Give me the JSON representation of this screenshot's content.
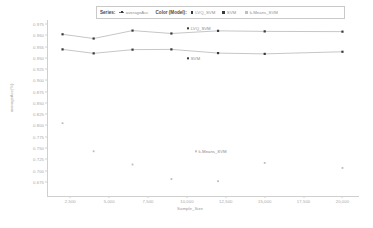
{
  "legend": {
    "series_title": "Series:",
    "series_item": "averageAcc",
    "color_title": "Color (Model):",
    "models": [
      "LVQ_SVM",
      "SVM",
      "k-Means_SVM"
    ]
  },
  "annotations": [
    {
      "text": "LVQ_SVM",
      "x": 10000,
      "y": 0.972
    },
    {
      "text": "SVM",
      "x": 10000,
      "y": 0.949
    },
    {
      "text": "k-Means_SVM",
      "x": 10500,
      "y": 0.879
    }
  ],
  "chart_data": {
    "type": "scatter",
    "title": "",
    "xlabel": "Sample_Size",
    "ylabel": "averageAcc(%)",
    "xlim": [
      1000,
      21000
    ],
    "ylim": [
      0.845,
      0.978
    ],
    "grid": false,
    "legend_position": "top",
    "xticks": [
      2500,
      5000,
      7500,
      10000,
      12500,
      15000,
      17500,
      20000
    ],
    "xtick_labels": [
      "2,500",
      "5,000",
      "7,500",
      "10,000",
      "12,500",
      "15,000",
      "17,500",
      "20,000"
    ],
    "yticks": [
      0.975,
      0.96,
      0.955,
      0.95,
      0.925,
      0.9,
      0.875,
      0.85,
      0.825,
      0.8,
      0.775,
      0.75,
      0.725,
      0.7,
      0.675
    ],
    "ytick_labels": [
      "0.975",
      "0.960",
      "0.955",
      "0.950",
      "0.925",
      "0.900",
      "0.875",
      "0.850",
      "0.825",
      "0.800",
      "0.775",
      "0.750",
      "0.725",
      "0.700",
      "0.675"
    ],
    "series": [
      {
        "name": "LVQ_SVM",
        "mode": "lines+markers",
        "color": "#3a3a3a",
        "x": [
          2000,
          4000,
          6500,
          9000,
          12000,
          15000,
          20000
        ],
        "y": [
          0.9672,
          0.964,
          0.97,
          0.9678,
          0.9698,
          0.9694,
          0.9692
        ]
      },
      {
        "name": "SVM",
        "mode": "lines+markers",
        "color": "#3a3a3a",
        "x": [
          2000,
          4000,
          6500,
          9000,
          12000,
          15000,
          20000
        ],
        "y": [
          0.9558,
          0.9528,
          0.9556,
          0.9558,
          0.953,
          0.9524,
          0.954
        ]
      },
      {
        "name": "k-Means_SVM",
        "mode": "markers",
        "color": "#bcbcbc",
        "x": [
          2000,
          4000,
          6500,
          9000,
          12000,
          15000,
          20000
        ],
        "y": [
          0.9,
          0.8788,
          0.8688,
          0.8578,
          0.8562,
          0.87,
          0.8662
        ]
      }
    ]
  }
}
